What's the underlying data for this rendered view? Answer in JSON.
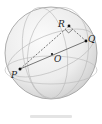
{
  "diagram": {
    "type": "sphere-geometry",
    "sphere": {
      "center": [
        51,
        53
      ],
      "radius": 46,
      "fill_light": "#f7f7f7",
      "fill_dark": "#d9d9d9",
      "outline": "#9a9a9a"
    },
    "points": [
      {
        "name": "P",
        "x": 20,
        "y": 69,
        "label_x": 11,
        "label_y": 78
      },
      {
        "name": "O",
        "x": 52,
        "y": 54,
        "label_x": 54,
        "label_y": 62
      },
      {
        "name": "Q",
        "x": 86,
        "y": 41,
        "label_x": 88,
        "label_y": 42
      },
      {
        "name": "R",
        "x": 69,
        "y": 26,
        "label_x": 58,
        "label_y": 27
      }
    ],
    "segments": [
      {
        "from": "P",
        "to": "Q",
        "style": "solid"
      },
      {
        "from": "P",
        "to": "R",
        "style": "dashed"
      },
      {
        "from": "R",
        "to": "Q",
        "style": "dashed"
      }
    ],
    "right_angle_at": "R",
    "colors": {
      "line": "#555555",
      "arc": "#b5b5b5",
      "point": "#111111"
    }
  }
}
